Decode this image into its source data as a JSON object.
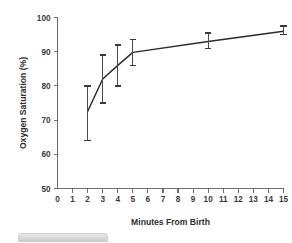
{
  "chart_data": {
    "type": "line",
    "title": "",
    "xlabel": "Minutes From Birth",
    "ylabel": "Oxygen Saturation (%)",
    "xlim": [
      0,
      15
    ],
    "ylim": [
      50,
      100
    ],
    "grid": false,
    "legend": "none",
    "xticks": [
      "0",
      "1",
      "2",
      "3",
      "4",
      "5",
      "6",
      "7",
      "8",
      "9",
      "10",
      "11",
      "12",
      "13",
      "14",
      "15"
    ],
    "yticks": [
      "50",
      "60",
      "70",
      "80",
      "90",
      "100"
    ],
    "x": [
      2,
      3,
      4,
      5,
      10,
      15
    ],
    "values": [
      72.5,
      82,
      86,
      89.8,
      93,
      96
    ],
    "error_low": [
      64,
      75,
      80,
      86,
      91,
      95
    ],
    "error_high": [
      80,
      89,
      92,
      93.5,
      95.5,
      97.5
    ],
    "series": [
      {
        "name": "Oxygen saturation",
        "points": [
          {
            "x": 2,
            "y": 72.5,
            "low": 64,
            "high": 80
          },
          {
            "x": 3,
            "y": 82,
            "low": 75,
            "high": 89
          },
          {
            "x": 4,
            "y": 86,
            "low": 80,
            "high": 92
          },
          {
            "x": 5,
            "y": 89.8,
            "low": 86,
            "high": 93.5
          },
          {
            "x": 10,
            "y": 93,
            "low": 91,
            "high": 95.5
          },
          {
            "x": 15,
            "y": 96,
            "low": 95,
            "high": 97.5
          }
        ]
      }
    ],
    "colors": {
      "line": "#2b2b2b",
      "errorbar": "#4a4a4a",
      "axis": "#6e6e6e",
      "text": "#3a3a3a",
      "background": "#ffffff"
    }
  },
  "figure": {
    "caption_bar_label": ""
  }
}
